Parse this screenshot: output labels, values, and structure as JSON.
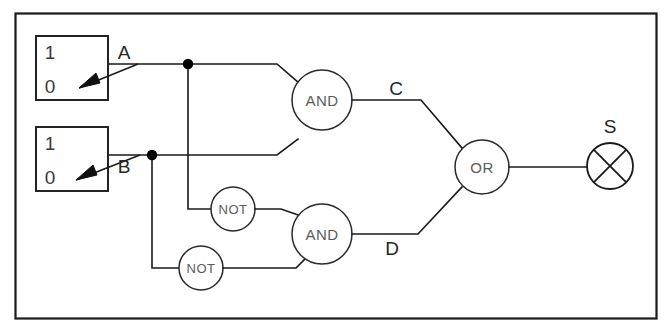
{
  "diagram": {
    "frame": {
      "visible": true,
      "color": "#1a1a1a"
    },
    "background": "#ffffff",
    "line_color": "#1a1a1a",
    "switches": [
      {
        "id": "switch-a",
        "label": "A",
        "top_value": "1",
        "bottom_value": "0",
        "position": "0",
        "arrow": "down-left"
      },
      {
        "id": "switch-b",
        "label": "B",
        "top_value": "1",
        "bottom_value": "0",
        "position": "0",
        "arrow": "down-left"
      }
    ],
    "gates": [
      {
        "id": "gate-and-top",
        "type": "AND",
        "label": "AND"
      },
      {
        "id": "gate-not-upper",
        "type": "NOT",
        "label": "NOT"
      },
      {
        "id": "gate-not-lower",
        "type": "NOT",
        "label": "NOT"
      },
      {
        "id": "gate-and-bottom",
        "type": "AND",
        "label": "AND"
      },
      {
        "id": "gate-or",
        "type": "OR",
        "label": "OR"
      }
    ],
    "signal_labels": [
      {
        "id": "signal-c",
        "label": "C"
      },
      {
        "id": "signal-d",
        "label": "D"
      }
    ],
    "output": {
      "id": "output-lamp",
      "label": "S",
      "symbol": "lamp"
    }
  }
}
